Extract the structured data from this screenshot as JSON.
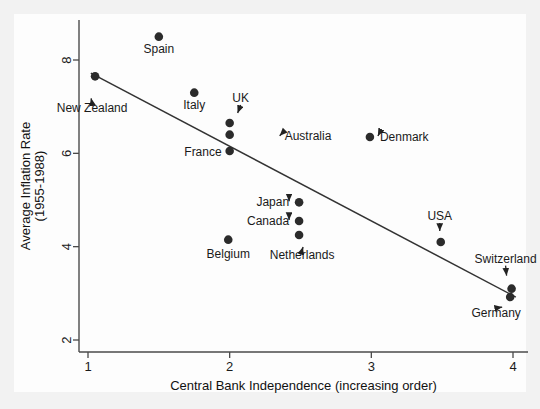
{
  "chart_data": {
    "type": "scatter",
    "title": "",
    "xlabel": "Central Bank Independence (increasing order)",
    "ylabel": "Average Inflation Rate\n(1955-1988)",
    "ylabel_line1": "Average Inflation Rate",
    "ylabel_line2": "(1955-1988)",
    "xlim": [
      0.8,
      4.2
    ],
    "ylim": [
      1.7,
      9.1
    ],
    "xticks": [
      1,
      2,
      3,
      4
    ],
    "xtick_labels": [
      "1",
      "2",
      "3",
      "4"
    ],
    "yticks": [
      2,
      4,
      6,
      8
    ],
    "ytick_labels": [
      "2",
      "4",
      "6",
      "8"
    ],
    "grid": false,
    "legend": "none",
    "points": [
      {
        "label": "Spain",
        "x": 1.5,
        "y": 8.5,
        "label_dx": 0,
        "label_dy": 16,
        "anchor": "middle",
        "leader": false
      },
      {
        "label": "New Zealand",
        "x": 1.05,
        "y": 7.65,
        "label_dx": -3,
        "label_dy": 36,
        "anchor": "middle",
        "leader": true,
        "leader_x2": -4,
        "leader_y2": 22
      },
      {
        "label": "Italy",
        "x": 1.75,
        "y": 7.3,
        "label_dx": 0,
        "label_dy": 16,
        "anchor": "middle",
        "leader": false
      },
      {
        "label": "UK",
        "x": 2.0,
        "y": 6.65,
        "label_dx": 11,
        "label_dy": -21,
        "anchor": "middle",
        "leader": true,
        "leader_x2": 8,
        "leader_y2": -10
      },
      {
        "label": "Australia",
        "x": 2.0,
        "y": 6.4,
        "label_dx": 55,
        "label_dy": 5,
        "anchor": "start",
        "leader": true,
        "leader_x2": 50,
        "leader_y2": 1
      },
      {
        "label": "France",
        "x": 2.0,
        "y": 6.05,
        "label_dx": -8,
        "label_dy": 5,
        "anchor": "end",
        "leader": false
      },
      {
        "label": "Denmark",
        "x": 2.99,
        "y": 6.35,
        "label_dx": 10,
        "label_dy": 4,
        "anchor": "start",
        "leader": true,
        "leader_x2": 8,
        "leader_y2": -1
      },
      {
        "label": "Japan",
        "x": 2.49,
        "y": 4.95,
        "label_dx": -10,
        "label_dy": 4,
        "anchor": "end",
        "leader": true,
        "leader_x2": -10,
        "leader_y2": -1
      },
      {
        "label": "Canada",
        "x": 2.49,
        "y": 4.55,
        "label_dx": -10,
        "label_dy": 4,
        "anchor": "end",
        "leader": true,
        "leader_x2": -10,
        "leader_y2": -1
      },
      {
        "label": "Netherlands",
        "x": 2.49,
        "y": 4.25,
        "label_dx": 3,
        "label_dy": 24,
        "anchor": "middle",
        "leader": true,
        "leader_x2": 4,
        "leader_y2": 12
      },
      {
        "label": "Belgium",
        "x": 1.99,
        "y": 4.15,
        "label_dx": 0,
        "label_dy": 18,
        "anchor": "middle",
        "leader": false
      },
      {
        "label": "USA",
        "x": 3.49,
        "y": 4.1,
        "label_dx": -1,
        "label_dy": -22,
        "anchor": "middle",
        "leader": true,
        "leader_x2": -1,
        "leader_y2": -11
      },
      {
        "label": "Switzerland",
        "x": 3.99,
        "y": 3.1,
        "label_dx": -6,
        "label_dy": -26,
        "anchor": "middle",
        "leader": true,
        "leader_x2": -5,
        "leader_y2": -13
      },
      {
        "label": "Germany",
        "x": 3.98,
        "y": 2.92,
        "label_dx": -14,
        "label_dy": 20,
        "anchor": "middle",
        "leader": true,
        "leader_x2": -8,
        "leader_y2": 10
      }
    ],
    "fit_line": {
      "x1": 1.02,
      "y1": 7.72,
      "x2": 4.02,
      "y2": 2.92,
      "style": "solid"
    }
  },
  "colors": {
    "marker": "#2b2b2b",
    "axis": "#4a4a4a",
    "fit_line": "#333333",
    "plot_background": "#fdfdfd",
    "page_background": "#f2f2f2",
    "text": "#1a1a1a"
  }
}
